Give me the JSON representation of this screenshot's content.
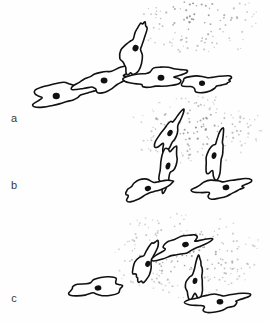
{
  "figure": {
    "background_color": "#fefefe",
    "ink_color": "#111111",
    "dot_color": "#8c8c8c",
    "label_color": "#3a3a3a",
    "width": 270,
    "height": 322
  },
  "panels": [
    {
      "id": "panel-a",
      "label": "a",
      "label_x": 14,
      "label_y": 119,
      "description": "Cells aligned in a diagonal chain extending up and to the right toward a diffuse dot cloud at the upper right.",
      "gradient": {
        "source_x": 196,
        "source_y": 14,
        "spread_x": 62,
        "spread_y": 46,
        "dot_count": 150,
        "dot_radius": 0.85
      },
      "cells": [
        {
          "id": "a-cell-1",
          "cx": 62,
          "cy": 94,
          "rx": 30,
          "ry": 11,
          "rotation": -10,
          "nucleus_dx": -6,
          "nucleus_dy": 1,
          "nucleus_rx": 3.6,
          "nucleus_ry": 3.2,
          "nucleus_rotation": 0,
          "seed": 11
        },
        {
          "id": "a-cell-2",
          "cx": 106,
          "cy": 80,
          "rx": 27,
          "ry": 10,
          "rotation": -16,
          "nucleus_dx": -2,
          "nucleus_dy": 0,
          "nucleus_rx": 3.4,
          "nucleus_ry": 3.0,
          "nucleus_rotation": 0,
          "seed": 23
        },
        {
          "id": "a-cell-3",
          "cx": 135,
          "cy": 50,
          "rx": 26,
          "ry": 10,
          "rotation": -74,
          "nucleus_dx": 2,
          "nucleus_dy": 0,
          "nucleus_rx": 3.4,
          "nucleus_ry": 3.0,
          "nucleus_rotation": -70,
          "seed": 37
        },
        {
          "id": "a-cell-4",
          "cx": 158,
          "cy": 78,
          "rx": 28,
          "ry": 10,
          "rotation": -6,
          "nucleus_dx": 3,
          "nucleus_dy": 0,
          "nucleus_rx": 3.4,
          "nucleus_ry": 3.0,
          "nucleus_rotation": 0,
          "seed": 51
        },
        {
          "id": "a-cell-5",
          "cx": 206,
          "cy": 83,
          "rx": 24,
          "ry": 8,
          "rotation": -4,
          "nucleus_dx": -4,
          "nucleus_dy": 0,
          "nucleus_rx": 3.0,
          "nucleus_ry": 2.7,
          "nucleus_rotation": 0,
          "seed": 67
        }
      ]
    },
    {
      "id": "panel-b",
      "label": "b",
      "label_x": 14,
      "label_y": 186,
      "description": "Cells curved and hooked, oriented upward toward a dot cloud occupying the upper portion of the panel.",
      "gradient": {
        "source_x": 196,
        "source_y": 130,
        "spread_x": 66,
        "spread_y": 34,
        "dot_count": 170,
        "dot_radius": 0.85
      },
      "cells": [
        {
          "id": "b-cell-1",
          "cx": 170,
          "cy": 133,
          "rx": 20,
          "ry": 8,
          "rotation": -60,
          "nucleus_dx": 0,
          "nucleus_dy": 0,
          "nucleus_rx": 3.4,
          "nucleus_ry": 2.4,
          "nucleus_rotation": -60,
          "seed": 83
        },
        {
          "id": "b-cell-2",
          "cx": 168,
          "cy": 166,
          "rx": 21,
          "ry": 8,
          "rotation": -74,
          "nucleus_dx": 0,
          "nucleus_dy": 0,
          "nucleus_rx": 3.6,
          "nucleus_ry": 2.3,
          "nucleus_rotation": -74,
          "seed": 97
        },
        {
          "id": "b-cell-3",
          "cx": 146,
          "cy": 189,
          "rx": 24,
          "ry": 8,
          "rotation": -16,
          "nucleus_dx": 2,
          "nucleus_dy": 0,
          "nucleus_rx": 3.2,
          "nucleus_ry": 2.6,
          "nucleus_rotation": -16,
          "seed": 109
        },
        {
          "id": "b-cell-4",
          "cx": 216,
          "cy": 156,
          "rx": 22,
          "ry": 8,
          "rotation": -78,
          "nucleus_dx": 0,
          "nucleus_dy": -2,
          "nucleus_rx": 3.4,
          "nucleus_ry": 2.4,
          "nucleus_rotation": -78,
          "seed": 127
        },
        {
          "id": "b-cell-5",
          "cx": 222,
          "cy": 188,
          "rx": 26,
          "ry": 9,
          "rotation": -8,
          "nucleus_dx": 4,
          "nucleus_dy": 0,
          "nucleus_rx": 3.4,
          "nucleus_ry": 2.8,
          "nucleus_rotation": -8,
          "seed": 139
        }
      ]
    },
    {
      "id": "panel-c",
      "label": "c",
      "label_x": 14,
      "label_y": 299,
      "description": "Cells arranged in an arch within a broad dot field spread across the right half of the panel.",
      "gradient": {
        "source_x": 186,
        "source_y": 255,
        "spread_x": 76,
        "spread_y": 40,
        "dot_count": 210,
        "dot_radius": 0.85
      },
      "cells": [
        {
          "id": "c-cell-1",
          "cx": 98,
          "cy": 288,
          "rx": 27,
          "ry": 9,
          "rotation": -6,
          "nucleus_dx": 0,
          "nucleus_dy": 0,
          "nucleus_rx": 3.4,
          "nucleus_ry": 2.6,
          "nucleus_rotation": -6,
          "seed": 151
        },
        {
          "id": "c-cell-2",
          "cx": 146,
          "cy": 263,
          "rx": 22,
          "ry": 8,
          "rotation": -66,
          "nucleus_dx": 0,
          "nucleus_dy": 2,
          "nucleus_rx": 3.2,
          "nucleus_ry": 2.5,
          "nucleus_rotation": -66,
          "seed": 163
        },
        {
          "id": "c-cell-3",
          "cx": 181,
          "cy": 247,
          "rx": 26,
          "ry": 9,
          "rotation": -18,
          "nucleus_dx": 5,
          "nucleus_dy": -1,
          "nucleus_rx": 3.4,
          "nucleus_ry": 2.7,
          "nucleus_rotation": -18,
          "seed": 179
        },
        {
          "id": "c-cell-4",
          "cx": 196,
          "cy": 281,
          "rx": 20,
          "ry": 8,
          "rotation": -80,
          "nucleus_dx": 0,
          "nucleus_dy": -1,
          "nucleus_rx": 3.2,
          "nucleus_ry": 2.4,
          "nucleus_rotation": -80,
          "seed": 191
        },
        {
          "id": "c-cell-5",
          "cx": 218,
          "cy": 302,
          "rx": 26,
          "ry": 9,
          "rotation": -6,
          "nucleus_dx": 2,
          "nucleus_dy": 0,
          "nucleus_rx": 3.4,
          "nucleus_ry": 2.7,
          "nucleus_rotation": -6,
          "seed": 211
        }
      ]
    }
  ]
}
